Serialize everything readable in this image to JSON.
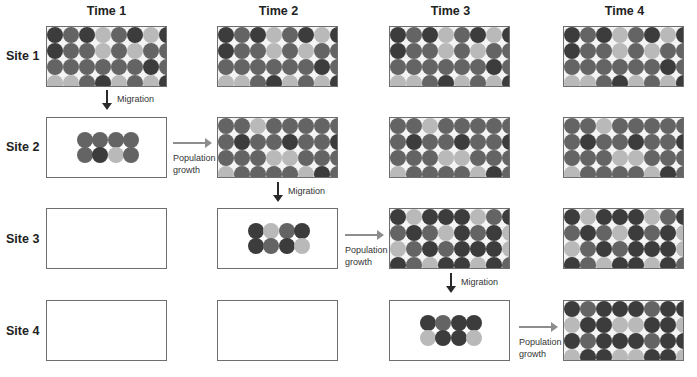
{
  "palette": {
    "D": "#3c3c3c",
    "M": "#646464",
    "L": "#b9b9b9"
  },
  "columns": [
    "Time 1",
    "Time 2",
    "Time 3",
    "Time 4"
  ],
  "rows": [
    "Site 1",
    "Site 2",
    "Site 3",
    "Site 4"
  ],
  "labels": {
    "migration": "Migration",
    "growth_line1": "Population",
    "growth_line2": "growth"
  },
  "patterns": {
    "site1": [
      "DMDLMDLD",
      "DMMLMLMM",
      "MMMMMMDM",
      "LLMDLMLD"
    ],
    "site2": [
      "MMLMMMMM",
      "MDMMDMMD",
      "MMMLLMMM",
      "LMMMMLDM"
    ],
    "site3": [
      "DLDDDLMD",
      "MDMLDMDL",
      "LMDMDDDL",
      "DMLDDLDM"
    ],
    "site4": [
      "DMDDDMDD",
      "LDDLLDDL",
      "DMDDDMDD",
      "LDDLLDDL"
    ],
    "cluster_site2": [
      "MMMM",
      "MDLM"
    ],
    "cluster_site3": [
      "DLMD",
      "DMDL"
    ],
    "cluster_site4": [
      "DMDD",
      "LDDL"
    ]
  },
  "cells": {
    "s1t1": "site1",
    "s1t2": "site1",
    "s1t3": "site1",
    "s1t4": "site1",
    "s2t1": "cluster_site2",
    "s2t2": "site2",
    "s2t3": "site2",
    "s2t4": "site2",
    "s3t1": "",
    "s3t2": "cluster_site3",
    "s3t3": "site3",
    "s3t4": "site3",
    "s4t1": "",
    "s4t2": "",
    "s4t3": "cluster_site4",
    "s4t4": "site4"
  }
}
